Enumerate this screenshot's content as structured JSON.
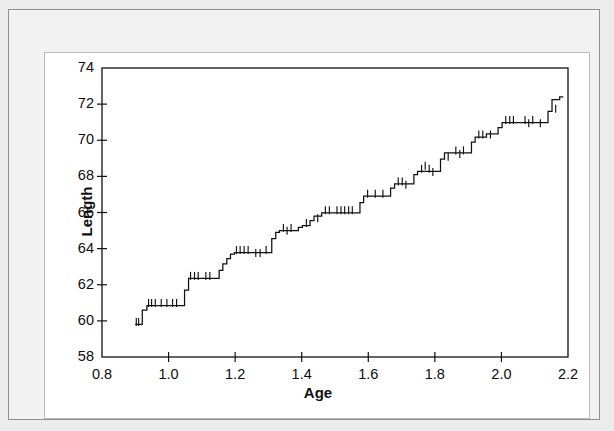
{
  "figure": {
    "background_color": "#ececed",
    "panel_color": "#ffffff",
    "line_color": "#111111"
  },
  "chart_data": {
    "type": "line",
    "subtype": "step",
    "title": "",
    "subtitle": "",
    "xlabel": "Age",
    "ylabel": "Length",
    "xlim": [
      0.8,
      2.2
    ],
    "ylim": [
      58,
      74
    ],
    "xticks": [
      0.8,
      1.0,
      1.2,
      1.4,
      1.6,
      1.8,
      2.0,
      2.2
    ],
    "xticklabels": [
      "0.8",
      "1.0",
      "1.2",
      "1.4",
      "1.6",
      "1.8",
      "2.0",
      "2.2"
    ],
    "yticks": [
      58,
      60,
      62,
      64,
      66,
      68,
      70,
      72,
      74
    ],
    "yticklabels": [
      "58",
      "60",
      "62",
      "64",
      "66",
      "68",
      "70",
      "72",
      "74"
    ],
    "grid": false,
    "legend": null,
    "legend_position": "none",
    "series": [
      {
        "name": "Length vs Age step curve",
        "x": [
          0.9,
          0.921,
          0.921,
          0.935,
          0.935,
          1.048,
          1.048,
          1.06,
          1.06,
          1.152,
          1.152,
          1.163,
          1.163,
          1.175,
          1.175,
          1.186,
          1.186,
          1.198,
          1.198,
          1.31,
          1.31,
          1.322,
          1.322,
          1.333,
          1.333,
          1.39,
          1.39,
          1.402,
          1.402,
          1.425,
          1.425,
          1.437,
          1.437,
          1.46,
          1.46,
          1.575,
          1.575,
          1.586,
          1.586,
          1.667,
          1.667,
          1.679,
          1.679,
          1.737,
          1.737,
          1.748,
          1.748,
          1.817,
          1.817,
          1.829,
          1.829,
          1.91,
          1.91,
          1.921,
          1.921,
          1.955,
          1.955,
          1.99,
          1.99,
          2.002,
          2.002,
          2.14,
          2.14,
          2.152,
          2.152,
          2.175,
          2.175,
          2.186
        ],
        "y": [
          59.8,
          59.8,
          60.6,
          60.6,
          60.85,
          60.85,
          61.7,
          61.7,
          62.35,
          62.35,
          62.8,
          62.8,
          63.15,
          63.15,
          63.45,
          63.45,
          63.7,
          63.7,
          63.78,
          63.78,
          64.55,
          64.55,
          64.9,
          64.9,
          65.0,
          65.0,
          65.18,
          65.18,
          65.28,
          65.28,
          65.55,
          65.55,
          65.8,
          65.8,
          65.98,
          65.98,
          66.55,
          66.55,
          66.9,
          66.9,
          67.35,
          67.35,
          67.58,
          67.58,
          68.1,
          68.1,
          68.28,
          68.28,
          68.95,
          68.95,
          69.3,
          69.3,
          69.9,
          69.9,
          70.18,
          70.18,
          70.35,
          70.35,
          70.7,
          70.7,
          70.98,
          70.98,
          71.6,
          71.6,
          72.25,
          72.25,
          72.4,
          72.4
        ],
        "censor_marks": [
          {
            "x": 0.903,
            "y": 59.8
          },
          {
            "x": 0.91,
            "y": 59.8
          },
          {
            "x": 0.94,
            "y": 60.85
          },
          {
            "x": 0.949,
            "y": 60.85
          },
          {
            "x": 0.96,
            "y": 60.85
          },
          {
            "x": 0.978,
            "y": 60.85
          },
          {
            "x": 0.995,
            "y": 60.85
          },
          {
            "x": 1.012,
            "y": 60.85
          },
          {
            "x": 1.024,
            "y": 60.85
          },
          {
            "x": 1.066,
            "y": 62.35
          },
          {
            "x": 1.078,
            "y": 62.35
          },
          {
            "x": 1.089,
            "y": 62.35
          },
          {
            "x": 1.112,
            "y": 62.35
          },
          {
            "x": 1.124,
            "y": 62.35
          },
          {
            "x": 1.204,
            "y": 63.78
          },
          {
            "x": 1.215,
            "y": 63.78
          },
          {
            "x": 1.227,
            "y": 63.78
          },
          {
            "x": 1.239,
            "y": 63.78
          },
          {
            "x": 1.262,
            "y": 63.62
          },
          {
            "x": 1.275,
            "y": 63.62
          },
          {
            "x": 1.293,
            "y": 63.78
          },
          {
            "x": 1.345,
            "y": 65.0
          },
          {
            "x": 1.356,
            "y": 64.85
          },
          {
            "x": 1.368,
            "y": 65.0
          },
          {
            "x": 1.414,
            "y": 65.28
          },
          {
            "x": 1.448,
            "y": 65.55
          },
          {
            "x": 1.471,
            "y": 65.98
          },
          {
            "x": 1.483,
            "y": 65.98
          },
          {
            "x": 1.506,
            "y": 65.98
          },
          {
            "x": 1.518,
            "y": 65.98
          },
          {
            "x": 1.529,
            "y": 65.98
          },
          {
            "x": 1.541,
            "y": 65.98
          },
          {
            "x": 1.552,
            "y": 65.98
          },
          {
            "x": 1.598,
            "y": 66.9
          },
          {
            "x": 1.621,
            "y": 66.9
          },
          {
            "x": 1.644,
            "y": 66.9
          },
          {
            "x": 1.69,
            "y": 67.58
          },
          {
            "x": 1.702,
            "y": 67.58
          },
          {
            "x": 1.713,
            "y": 67.4
          },
          {
            "x": 1.76,
            "y": 68.28
          },
          {
            "x": 1.771,
            "y": 68.45
          },
          {
            "x": 1.783,
            "y": 68.28
          },
          {
            "x": 1.794,
            "y": 68.1
          },
          {
            "x": 1.84,
            "y": 68.95
          },
          {
            "x": 1.863,
            "y": 69.3
          },
          {
            "x": 1.875,
            "y": 69.1
          },
          {
            "x": 1.886,
            "y": 69.3
          },
          {
            "x": 1.932,
            "y": 70.18
          },
          {
            "x": 1.944,
            "y": 70.18
          },
          {
            "x": 1.967,
            "y": 70.18
          },
          {
            "x": 2.013,
            "y": 70.98
          },
          {
            "x": 2.025,
            "y": 70.98
          },
          {
            "x": 2.036,
            "y": 70.98
          },
          {
            "x": 2.071,
            "y": 70.98
          },
          {
            "x": 2.082,
            "y": 70.8
          },
          {
            "x": 2.094,
            "y": 70.98
          },
          {
            "x": 2.117,
            "y": 70.8
          },
          {
            "x": 2.163,
            "y": 71.6
          }
        ]
      }
    ]
  }
}
